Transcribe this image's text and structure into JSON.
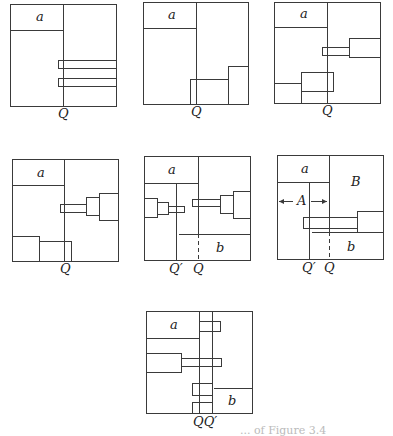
{
  "figure": {
    "stroke_color": "#3a3a3a",
    "background": "#ffffff",
    "caption_fragment": "... of Figure 3.4",
    "panels": [
      {
        "id": "panel-1",
        "frame": [
          10,
          4,
          116,
          106
        ],
        "a_box": [
          10,
          4,
          63,
          30
        ],
        "labels": [
          {
            "text": "a",
            "x": 36,
            "y": 21
          },
          {
            "text": "Q",
            "x": 58,
            "y": 118
          }
        ],
        "lines": [
          [
            63,
            4,
            63,
            106
          ]
        ],
        "dashed": [],
        "rects": [
          [
            58,
            60,
            116,
            68
          ],
          [
            58,
            78,
            116,
            86
          ]
        ],
        "arrows": []
      },
      {
        "id": "panel-2",
        "frame": [
          143,
          2,
          248,
          104
        ],
        "a_box": [
          143,
          2,
          196,
          28
        ],
        "labels": [
          {
            "text": "a",
            "x": 168,
            "y": 19
          },
          {
            "text": "Q",
            "x": 191,
            "y": 116
          }
        ],
        "lines": [
          [
            196,
            2,
            196,
            104
          ]
        ],
        "dashed": [],
        "rects": [
          [
            190,
            79,
            228,
            104
          ],
          [
            228,
            66,
            248,
            104
          ]
        ],
        "arrows": []
      },
      {
        "id": "panel-3",
        "frame": [
          274,
          2,
          380,
          103
        ],
        "a_box": [
          274,
          2,
          327,
          27
        ],
        "labels": [
          {
            "text": "a",
            "x": 300,
            "y": 18
          },
          {
            "text": "Q",
            "x": 322,
            "y": 115
          }
        ],
        "lines": [
          [
            327,
            2,
            327,
            103
          ]
        ],
        "dashed": [],
        "rects": [
          [
            322,
            47,
            349,
            55
          ],
          [
            349,
            38,
            380,
            57
          ],
          [
            274,
            83,
            301,
            103
          ],
          [
            301,
            72,
            333,
            91
          ]
        ],
        "arrows": []
      },
      {
        "id": "panel-4",
        "frame": [
          12,
          159,
          118,
          261
        ],
        "a_box": [
          12,
          159,
          64,
          185
        ],
        "labels": [
          {
            "text": "a",
            "x": 37,
            "y": 177
          },
          {
            "text": "Q",
            "x": 60,
            "y": 273
          }
        ],
        "lines": [
          [
            64,
            159,
            64,
            261
          ]
        ],
        "dashed": [],
        "rects": [
          [
            60,
            204,
            86,
            212
          ],
          [
            86,
            197,
            99,
            215
          ],
          [
            99,
            193,
            118,
            220
          ],
          [
            12,
            236,
            39,
            261
          ],
          [
            39,
            241,
            71,
            261
          ]
        ],
        "arrows": []
      },
      {
        "id": "panel-5",
        "frame": [
          144,
          156,
          250,
          260
        ],
        "a_box": [
          144,
          156,
          198,
          183
        ],
        "labels": [
          {
            "text": "a",
            "x": 168,
            "y": 174
          },
          {
            "text": "b",
            "x": 216,
            "y": 252
          },
          {
            "text": "Q′",
            "x": 169,
            "y": 273
          },
          {
            "text": "Q",
            "x": 193,
            "y": 273
          }
        ],
        "lines": [
          [
            198,
            156,
            198,
            234
          ],
          [
            176,
            183,
            176,
            260
          ],
          [
            176,
            234,
            250,
            234
          ]
        ],
        "dashed": [
          [
            198,
            234,
            198,
            260
          ]
        ],
        "rects": [
          [
            144,
            198,
            157,
            217
          ],
          [
            157,
            202,
            168,
            214
          ],
          [
            168,
            206,
            184,
            212
          ],
          [
            192,
            199,
            220,
            206
          ],
          [
            220,
            195,
            233,
            213
          ],
          [
            233,
            191,
            250,
            218
          ]
        ],
        "arrows": []
      },
      {
        "id": "panel-6",
        "frame": [
          277,
          155,
          383,
          259
        ],
        "a_box": [
          277,
          155,
          329,
          182
        ],
        "labels": [
          {
            "text": "a",
            "x": 301,
            "y": 173
          },
          {
            "text": "B",
            "x": 351,
            "y": 186
          },
          {
            "text": "A",
            "x": 297,
            "y": 205
          },
          {
            "text": "b",
            "x": 347,
            "y": 251
          },
          {
            "text": "Q′",
            "x": 302,
            "y": 272
          },
          {
            "text": "Q",
            "x": 324,
            "y": 272
          }
        ],
        "lines": [
          [
            329,
            155,
            329,
            232
          ],
          [
            309,
            182,
            309,
            259
          ],
          [
            309,
            232,
            383,
            232
          ],
          [
            309,
            228,
            357,
            228
          ]
        ],
        "dashed": [
          [
            329,
            232,
            329,
            259
          ]
        ],
        "rects": [
          [
            303,
            217,
            357,
            228
          ],
          [
            357,
            211,
            383,
            232
          ]
        ],
        "arrows": [
          {
            "from": [
              293,
              201
            ],
            "to": [
              279,
              201
            ]
          },
          {
            "from": [
              311,
              201
            ],
            "to": [
              327,
              201
            ]
          }
        ]
      },
      {
        "id": "panel-7",
        "frame": [
          146,
          311,
          252,
          413
        ],
        "a_box": [
          146,
          311,
          199,
          338
        ],
        "labels": [
          {
            "text": "a",
            "x": 170,
            "y": 329
          },
          {
            "text": "b",
            "x": 228,
            "y": 405
          },
          {
            "text": "QQ′",
            "x": 193,
            "y": 426
          }
        ],
        "lines": [
          [
            199,
            311,
            199,
            413
          ],
          [
            212,
            311,
            212,
            413
          ],
          [
            212,
            388,
            252,
            388
          ]
        ],
        "dashed": [],
        "rects": [
          [
            199,
            321,
            220,
            331
          ],
          [
            146,
            353,
            181,
            372
          ],
          [
            181,
            358,
            221,
            366
          ],
          [
            192,
            383,
            212,
            395
          ],
          [
            192,
            402,
            212,
            413
          ]
        ],
        "arrows": []
      }
    ]
  }
}
